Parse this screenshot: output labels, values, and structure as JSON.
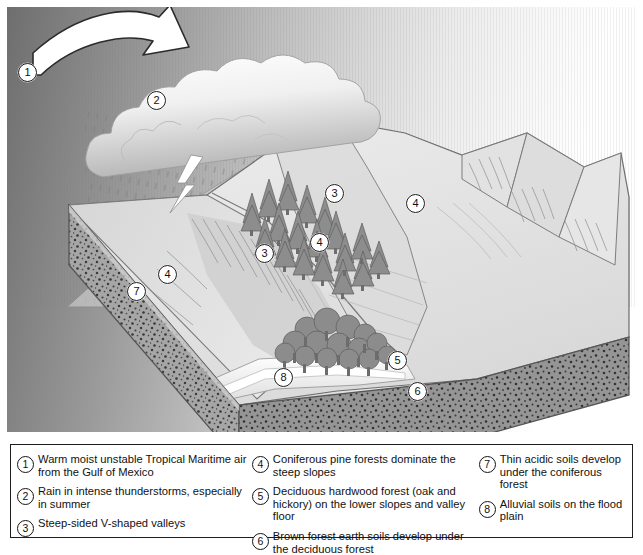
{
  "diagram": {
    "callouts": [
      {
        "n": "1",
        "x": 11,
        "y": 56,
        "name": "callout-1-air-mass"
      },
      {
        "n": "2",
        "x": 140,
        "y": 84,
        "name": "callout-2-rain"
      },
      {
        "n": "3",
        "x": 318,
        "y": 177,
        "name": "callout-3-valley-upper"
      },
      {
        "n": "3",
        "x": 248,
        "y": 237,
        "name": "callout-3-valley-lower"
      },
      {
        "n": "4",
        "x": 399,
        "y": 187,
        "name": "callout-4-conifer-right"
      },
      {
        "n": "4",
        "x": 303,
        "y": 226,
        "name": "callout-4-conifer-mid"
      },
      {
        "n": "4",
        "x": 151,
        "y": 258,
        "name": "callout-4-conifer-left"
      },
      {
        "n": "7",
        "x": 120,
        "y": 275,
        "name": "callout-7-thin-acidic-soil"
      },
      {
        "n": "5",
        "x": 381,
        "y": 344,
        "name": "callout-5-deciduous"
      },
      {
        "n": "8",
        "x": 267,
        "y": 361,
        "name": "callout-8-alluvial"
      },
      {
        "n": "6",
        "x": 401,
        "y": 375,
        "name": "callout-6-brown-earth"
      }
    ],
    "colors": {
      "sky_dark": "#6e6e6e",
      "sky_light": "#ffffff",
      "land_light": "#e3e3e3",
      "land_mid": "#d2d2d2",
      "land_shadow": "#bfbfbf",
      "soil_block": "#9e9e9e",
      "conifer": "#8a8a8a",
      "deciduous": "#8f8f8f",
      "outline": "#5a5a5a",
      "river": "#f2f2f2",
      "frame": "#1d1d1d"
    }
  },
  "legend": {
    "columns": [
      {
        "name": "legend-column-1",
        "items": [
          {
            "n": "1",
            "text": "Warm moist unstable Tropical Maritime air from the Gulf of Mexico"
          },
          {
            "n": "2",
            "text": "Rain in intense thunderstorms, especially in summer"
          },
          {
            "n": "3",
            "text": "Steep-sided V-shaped valleys"
          }
        ]
      },
      {
        "name": "legend-column-2",
        "items": [
          {
            "n": "4",
            "text": "Coniferous pine forests dominate the steep slopes"
          },
          {
            "n": "5",
            "text": "Deciduous hardwood forest (oak and hickory) on the lower slopes and valley floor"
          },
          {
            "n": "6",
            "text": "Brown forest earth soils develop under the deciduous forest"
          }
        ]
      },
      {
        "name": "legend-column-3",
        "items": [
          {
            "n": "7",
            "text": "Thin acidic soils develop under the coniferous forest"
          },
          {
            "n": "8",
            "text": "Alluvial soils on the flood plain"
          }
        ]
      }
    ]
  }
}
